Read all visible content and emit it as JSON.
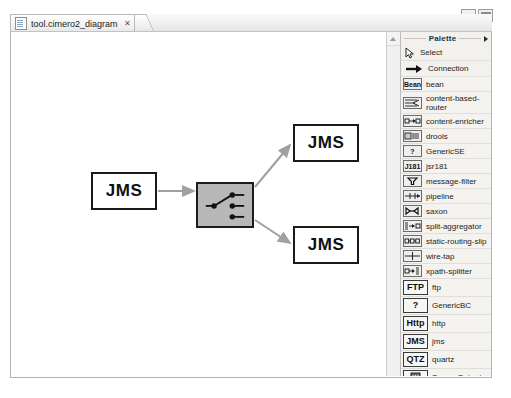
{
  "window": {
    "minimize_label": "minimize",
    "maximize_label": "maximize"
  },
  "editor": {
    "tab": {
      "title": "tool.cimero2_diagram",
      "close_glyph": "✕",
      "icon_name": "diagram-file-icon"
    }
  },
  "canvas": {
    "nodes": [
      {
        "id": "jms-in",
        "label": "JMS",
        "x": 80,
        "y": 140,
        "w": 66,
        "h": 38,
        "type": "endpoint"
      },
      {
        "id": "router",
        "label": "",
        "x": 185,
        "y": 150,
        "w": 58,
        "h": 46,
        "type": "content-based-router"
      },
      {
        "id": "jms-out-top",
        "label": "JMS",
        "x": 282,
        "y": 92,
        "w": 66,
        "h": 38,
        "type": "endpoint"
      },
      {
        "id": "jms-out-bottom",
        "label": "JMS",
        "x": 282,
        "y": 194,
        "w": 66,
        "h": 38,
        "type": "endpoint"
      }
    ],
    "connections": [
      {
        "from": "jms-in",
        "to": "router"
      },
      {
        "from": "router",
        "to": "jms-out-top"
      },
      {
        "from": "router",
        "to": "jms-out-bottom"
      }
    ],
    "connection_color": "#a0a0a0",
    "node_border_color": "#1a1a1a",
    "router_fill_color": "#b8b8b8"
  },
  "scrollbar": {
    "up_arrow_label": "scroll up"
  },
  "palette": {
    "title": "Palette",
    "caret_label": "collapse palette",
    "tools": [
      {
        "label": "Select",
        "icon": "cursor-arrow-icon"
      },
      {
        "label": "Connection",
        "icon": "connection-arrow-icon"
      }
    ],
    "components": [
      {
        "label": "bean",
        "icon_text": "Bean",
        "icon": "bean-icon",
        "two_line": false
      },
      {
        "label": "content-based-router",
        "icon_text": "",
        "icon": "content-based-router-icon",
        "two_line": true
      },
      {
        "label": "content-enricher",
        "icon_text": "",
        "icon": "content-enricher-icon",
        "two_line": false
      },
      {
        "label": "drools",
        "icon_text": "",
        "icon": "drools-icon",
        "two_line": false
      },
      {
        "label": "GenericSE",
        "icon_text": "?",
        "icon": "generic-se-icon",
        "two_line": false
      },
      {
        "label": "jsr181",
        "icon_text": "J181",
        "icon": "jsr181-icon",
        "two_line": false
      },
      {
        "label": "message-filter",
        "icon_text": "",
        "icon": "message-filter-icon",
        "two_line": false
      },
      {
        "label": "pipeline",
        "icon_text": "",
        "icon": "pipeline-icon",
        "two_line": false
      },
      {
        "label": "saxon",
        "icon_text": "",
        "icon": "saxon-icon",
        "two_line": false
      },
      {
        "label": "split-aggregator",
        "icon_text": "",
        "icon": "split-aggregator-icon",
        "two_line": false
      },
      {
        "label": "static-routing-slip",
        "icon_text": "",
        "icon": "static-routing-slip-icon",
        "two_line": false
      },
      {
        "label": "wire-tap",
        "icon_text": "",
        "icon": "wire-tap-icon",
        "two_line": false
      },
      {
        "label": "xpath-splitter",
        "icon_text": "",
        "icon": "xpath-splitter-icon",
        "two_line": false
      }
    ],
    "bindings": [
      {
        "label": "ftp",
        "icon_text": "FTP",
        "icon": "ftp-icon"
      },
      {
        "label": "GenericBC",
        "icon_text": "?",
        "icon": "generic-bc-icon"
      },
      {
        "label": "http",
        "icon_text": "Http",
        "icon": "http-icon"
      },
      {
        "label": "jms",
        "icon_text": "JMS",
        "icon": "jms-icon"
      },
      {
        "label": "quartz",
        "icon_text": "QTZ",
        "icon": "quartz-icon"
      },
      {
        "label": "ScreenOutput",
        "icon_text": "",
        "icon": "screen-output-icon"
      }
    ]
  }
}
